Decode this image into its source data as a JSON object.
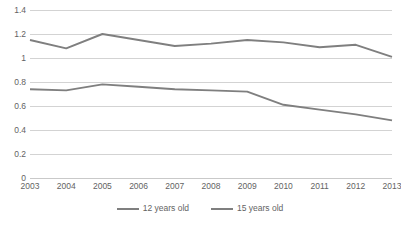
{
  "chart_data": {
    "type": "line",
    "title": "",
    "xlabel": "",
    "ylabel": "",
    "categories": [
      "2003",
      "2004",
      "2005",
      "2006",
      "2007",
      "2008",
      "2009",
      "2010",
      "2011",
      "2012",
      "2013"
    ],
    "series": [
      {
        "name": "12 years old",
        "color": "#7f7f7f",
        "values": [
          0.74,
          0.73,
          0.78,
          0.76,
          0.74,
          0.73,
          0.72,
          0.61,
          0.57,
          0.53,
          0.48
        ]
      },
      {
        "name": "15 years old",
        "color": "#7f7f7f",
        "values": [
          1.15,
          1.08,
          1.2,
          1.15,
          1.1,
          1.12,
          1.15,
          1.13,
          1.09,
          1.11,
          1.01
        ]
      }
    ],
    "ylim": [
      0,
      1.4
    ],
    "y_ticks": [
      "0",
      "0.2",
      "0.4",
      "0.6",
      "0.8",
      "1",
      "1.2",
      "1.4"
    ],
    "y_tick_values": [
      0,
      0.2,
      0.4,
      0.6,
      0.8,
      1,
      1.2,
      1.4
    ],
    "grid": true,
    "legend_position": "bottom",
    "gridline_color": "#d3d3d3",
    "text_color": "#636363"
  }
}
